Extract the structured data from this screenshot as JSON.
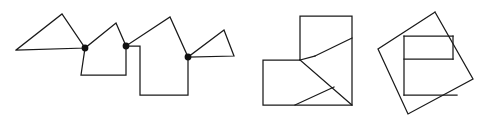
{
  "figure": {
    "canvas": {
      "width": 484,
      "height": 121,
      "background": "#ffffff"
    },
    "style": {
      "stroke_color": "#1a1a1a",
      "stroke_width": 1.25,
      "dot_color": "#111111",
      "dot_radius": 3.4
    }
  },
  "panels": [
    {
      "id": "panel-chain",
      "label": "Polygon chain linked at shared vertices",
      "shapes": [
        {
          "id": "chain-quadrilateral",
          "label": "Quadrilateral",
          "points": "16,50 62,14 85,48 16,50"
        },
        {
          "id": "chain-pentagon-small",
          "label": "Small pentagon",
          "points": "85,48 116,23 126,46 126,75 81,75 85,48"
        },
        {
          "id": "chain-pentagon-large",
          "label": "Large pentagon",
          "points": "126,46 170,17 188,57 188,95 140,95 140,46 126,46"
        },
        {
          "id": "chain-triangle",
          "label": "Triangle",
          "points": "188,57 224,30 234,56 188,57"
        }
      ],
      "vertex_dots": [
        {
          "id": "joint-1",
          "label": "Shared vertex 1",
          "cx": 85,
          "cy": 48
        },
        {
          "id": "joint-2",
          "label": "Shared vertex 2",
          "cx": 126,
          "cy": 46
        },
        {
          "id": "joint-3",
          "label": "Shared vertex 3",
          "cx": 188,
          "cy": 57
        }
      ]
    },
    {
      "id": "panel-lshape",
      "label": "L-shaped hexagon with internal dissection",
      "outline": {
        "id": "lshape-outline",
        "label": "L-shaped hexagon outline",
        "points": "300,16 352,16 352,105 263,105 263,60 300,60 300,16"
      },
      "cuts": [
        {
          "id": "cut-a",
          "label": "Diagonal cut A",
          "x1": 300,
          "y1": 60,
          "x2": 352,
          "y2": 105
        },
        {
          "id": "cut-b",
          "label": "Diagonal cut B",
          "x1": 315,
          "y1": 56,
          "x2": 352,
          "y2": 38
        },
        {
          "id": "cut-c",
          "label": "Diagonal cut C",
          "x1": 300,
          "y1": 60,
          "x2": 315,
          "y2": 56
        },
        {
          "id": "cut-d",
          "label": "Diagonal cut D",
          "x1": 295,
          "y1": 105,
          "x2": 334,
          "y2": 87
        }
      ]
    },
    {
      "id": "panel-tilted-square",
      "label": "Tilted square with inscribed rectangle",
      "outline": {
        "id": "tilted-square-outline",
        "label": "Tilted square outline",
        "points": "435,12 473,79 408,114 378,49 435,12"
      },
      "cuts": [
        {
          "id": "inner-top",
          "label": "Inner rectangle top edge",
          "x1": 404,
          "y1": 36,
          "x2": 453,
          "y2": 36
        },
        {
          "id": "inner-middle",
          "label": "Inner rectangle middle edge",
          "x1": 404,
          "y1": 59,
          "x2": 453,
          "y2": 59
        },
        {
          "id": "inner-left",
          "label": "Inner rectangle left edge",
          "x1": 404,
          "y1": 36,
          "x2": 404,
          "y2": 95
        },
        {
          "id": "inner-right",
          "label": "Inner rectangle right edge",
          "x1": 453,
          "y1": 36,
          "x2": 453,
          "y2": 59
        },
        {
          "id": "inner-bottom",
          "label": "Inner rectangle bottom edge",
          "x1": 404,
          "y1": 95,
          "x2": 457,
          "y2": 95
        }
      ]
    }
  ]
}
